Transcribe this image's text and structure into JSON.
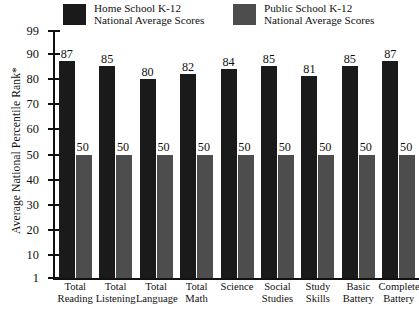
{
  "chart_data": {
    "type": "bar",
    "title": "",
    "xlabel": "",
    "ylabel": "Average National Percentile Rank*",
    "ylim": [
      1,
      99
    ],
    "yticks": [
      1,
      10,
      20,
      30,
      40,
      50,
      60,
      70,
      80,
      90,
      99
    ],
    "grid": false,
    "legend_position": "top",
    "categories": [
      "Total Reading",
      "Total Listening",
      "Total Language",
      "Total Math",
      "Science",
      "Social Studies",
      "Study Skills",
      "Basic Battery",
      "Complete Battery"
    ],
    "category_lines": [
      [
        "Total",
        "Reading"
      ],
      [
        "Total",
        "Listening"
      ],
      [
        "Total",
        "Language"
      ],
      [
        "Total",
        "Math"
      ],
      [
        "Science",
        ""
      ],
      [
        "Social",
        "Studies"
      ],
      [
        "Study",
        "Skills"
      ],
      [
        "Basic",
        "Battery"
      ],
      [
        "Complete",
        "Battery"
      ]
    ],
    "series": [
      {
        "name": "Home School K-12 National Average Scores",
        "color": "#1a1a1a",
        "values": [
          87,
          85,
          80,
          82,
          84,
          85,
          81,
          85,
          87
        ]
      },
      {
        "name": "Public School K-12 National Average Scores",
        "color": "#4d4d4d",
        "values": [
          50,
          50,
          50,
          50,
          50,
          50,
          50,
          50,
          50
        ]
      }
    ]
  },
  "legend": {
    "entries": [
      {
        "swatch": "#1a1a1a",
        "line1": "Home School K-12",
        "line2": "National Average Scores"
      },
      {
        "swatch": "#4d4d4d",
        "line1": "Public School K-12",
        "line2": "National Average Scores"
      }
    ]
  },
  "axis": {
    "y_title": "Average National Percentile Rank*"
  }
}
